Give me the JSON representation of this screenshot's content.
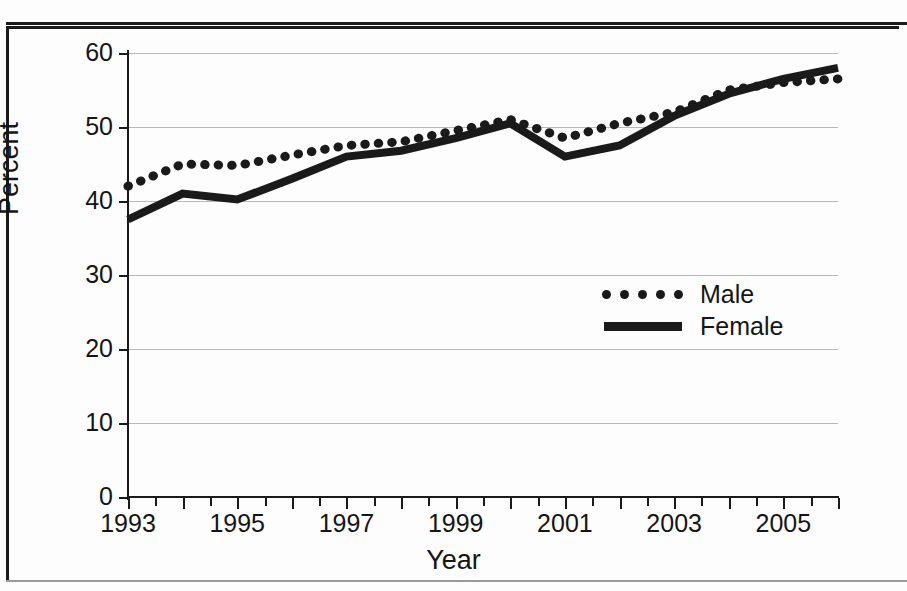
{
  "chart_data": {
    "type": "line",
    "title": "",
    "xlabel": "Year",
    "ylabel": "Percent",
    "xlim": [
      1993,
      2006
    ],
    "ylim": [
      0,
      60
    ],
    "ytick_labels": [
      "60",
      "50",
      "40",
      "30",
      "20",
      "10",
      "0"
    ],
    "ytick_values": [
      60,
      50,
      40,
      30,
      20,
      10,
      0
    ],
    "xtick_labels": [
      "1993",
      "1995",
      "1997",
      "1999",
      "2001",
      "2003",
      "2005"
    ],
    "xtick_values": [
      1993,
      1995,
      1997,
      1999,
      2001,
      2003,
      2005
    ],
    "minor_tick_interval": 0.5,
    "grid": "horizontal",
    "legend_position": "inside-right-center",
    "x": [
      1993,
      1994,
      1995,
      1996,
      1997,
      1998,
      1999,
      2000,
      2001,
      2002,
      2003,
      2004,
      2005,
      2006
    ],
    "series": [
      {
        "name": "Male",
        "style": "dotted",
        "color": "#1a1a1a",
        "values": [
          42.0,
          45.0,
          44.8,
          46.2,
          47.5,
          48.0,
          49.5,
          51.0,
          48.5,
          50.5,
          52.0,
          55.0,
          56.0,
          56.5
        ]
      },
      {
        "name": "Female",
        "style": "solid",
        "color": "#1a1a1a",
        "values": [
          37.5,
          41.0,
          40.2,
          43.0,
          46.0,
          46.8,
          48.5,
          50.5,
          46.0,
          47.5,
          51.5,
          54.5,
          56.5,
          58.0
        ]
      }
    ]
  },
  "legend": {
    "items": [
      {
        "label": "Male",
        "key": "dotted-line-key"
      },
      {
        "label": "Female",
        "key": "solid-line-key"
      }
    ]
  },
  "axes": {
    "y_title": "Percent",
    "x_title": "Year"
  }
}
